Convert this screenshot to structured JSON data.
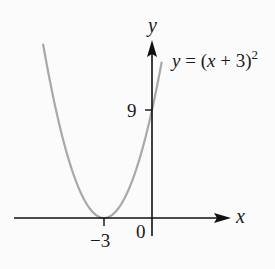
{
  "chart_data": {
    "type": "line",
    "title": "",
    "equation_label": "y = (x + 3)^2",
    "equation": {
      "prefix": "y = (x + 3)",
      "exponent": "2"
    },
    "xlabel": "x",
    "ylabel": "y",
    "x_ticks": [
      {
        "value": -3,
        "label": "−3"
      }
    ],
    "y_ticks": [
      {
        "value": 9,
        "label": "9"
      }
    ],
    "origin_label": "0",
    "xlim": [
      -6.8,
      4.8
    ],
    "ylim": [
      0,
      14.8
    ],
    "series": [
      {
        "name": "y = (x + 3)^2",
        "color": "#a8a8a8",
        "x": [
          -6.8,
          -6,
          -5,
          -4,
          -3,
          -2,
          -1,
          0,
          0.6
        ],
        "values": [
          14.44,
          9,
          4,
          1,
          0,
          1,
          4,
          9,
          12.96
        ]
      }
    ],
    "key_points": [
      {
        "x": -3,
        "y": 0,
        "note": "vertex on x-axis"
      },
      {
        "x": 0,
        "y": 9,
        "note": "y-intercept"
      }
    ],
    "grid": false,
    "legend": "none"
  },
  "colors": {
    "axis": "#111111",
    "curve": "#a8a8a8",
    "background": "#fbfbfb"
  }
}
